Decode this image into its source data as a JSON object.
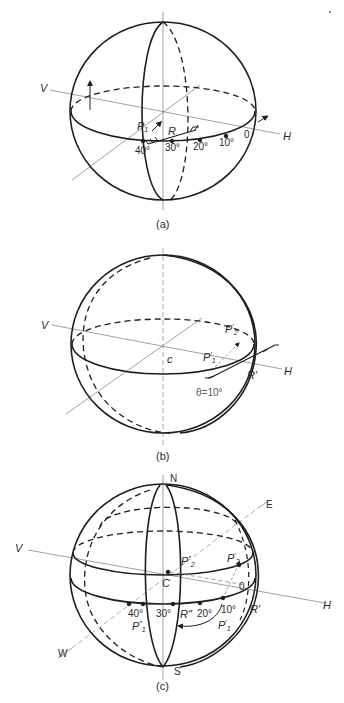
{
  "figure": {
    "panels": [
      {
        "id": "a",
        "caption": "(a)",
        "axis_labels": {
          "v": "V",
          "h": "H"
        },
        "point_labels": {
          "p1": "P",
          "p1_sub": "1",
          "r": "R"
        },
        "scale_ticks": [
          "40°",
          "30°",
          "20°",
          "10°",
          "0"
        ]
      },
      {
        "id": "b",
        "caption": "(b)",
        "axis_labels": {
          "v": "V",
          "h": "H"
        },
        "center_label": "c",
        "point_labels": {
          "p2": "P",
          "p2_prime": "′",
          "p2_sub": "2",
          "p1": "P",
          "p1_prime": "′",
          "p1_sub": "1",
          "r": "R′"
        },
        "angle_label": "θ=10°"
      },
      {
        "id": "c",
        "caption": "(c)",
        "axis_labels": {
          "v": "V",
          "h": "H",
          "n": "N",
          "s": "S",
          "e": "E",
          "w": "W"
        },
        "center_label": "C",
        "point_labels": {
          "p2pp": "P",
          "p2pp_prime": "″",
          "p2pp_sub": "2",
          "p2p": "P",
          "p2p_prime": "′",
          "p2p_sub": "2",
          "p1pp": "P",
          "p1pp_prime": "″",
          "p1pp_sub": "1",
          "p1p": "P",
          "p1p_prime": "′",
          "p1p_sub": "1",
          "rpp": "R″",
          "rp": "R′",
          "zero": "0"
        },
        "scale_ticks": [
          "40°",
          "30°",
          "20°",
          "10°"
        ]
      }
    ]
  },
  "colors": {
    "stroke": "#1e1e1e",
    "axis": "#6b6b6b",
    "background": "#ffffff"
  }
}
